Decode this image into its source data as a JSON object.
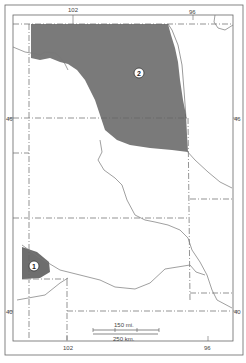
{
  "map": {
    "longitude_labels_top": [
      "102",
      "96"
    ],
    "longitude_labels_bottom": [
      "102",
      "96"
    ],
    "latitude_labels_left": [
      "46",
      "40"
    ],
    "latitude_labels_right": [
      "46",
      "40"
    ],
    "regions": [
      {
        "id": "1",
        "label": "1",
        "fill": "#6e6e6e"
      },
      {
        "id": "2",
        "label": "2",
        "fill": "#7a7a7a"
      }
    ],
    "scale_bar": {
      "miles_label": "150 mi.",
      "km_label": "250 km."
    },
    "colors": {
      "frame": "#555555",
      "boundary": "#666666",
      "river": "#777777",
      "shade": "#777777",
      "background": "#ffffff"
    }
  }
}
